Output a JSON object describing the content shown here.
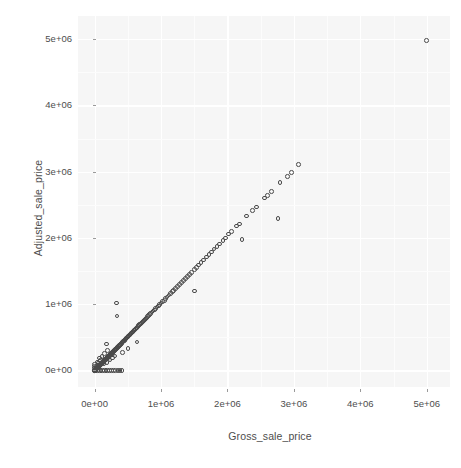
{
  "chart_data": {
    "type": "scatter",
    "title": "",
    "xlabel": "Gross_sale_price",
    "ylabel": "Adjusted_sale_price",
    "xlim": [
      -250000,
      5350000
    ],
    "ylim": [
      -250000,
      5350000
    ],
    "xticks": [
      0,
      1000000,
      2000000,
      3000000,
      4000000,
      5000000
    ],
    "yticks": [
      0,
      1000000,
      2000000,
      3000000,
      4000000,
      5000000
    ],
    "xtick_labels": [
      "0e+00",
      "1e+06",
      "2e+06",
      "3e+06",
      "4e+06",
      "5e+06"
    ],
    "ytick_labels": [
      "0e+00",
      "1e+06",
      "2e+06",
      "3e+06",
      "4e+06",
      "5e+06"
    ],
    "grid": true,
    "legend": "none",
    "marker": "open-circle",
    "marker_color": "#4a4a4a",
    "panel_background": "#f6f6f6",
    "grid_color": "#ffffff",
    "points": [
      [
        5000000,
        4980000
      ],
      [
        3070000,
        3110000
      ],
      [
        2960000,
        2990000
      ],
      [
        2900000,
        2930000
      ],
      [
        2790000,
        2840000
      ],
      [
        2760000,
        2290000
      ],
      [
        2660000,
        2700000
      ],
      [
        2600000,
        2640000
      ],
      [
        2560000,
        2600000
      ],
      [
        2440000,
        2470000
      ],
      [
        2380000,
        2410000
      ],
      [
        2290000,
        2330000
      ],
      [
        2180000,
        2210000
      ],
      [
        2140000,
        2180000
      ],
      [
        2060000,
        2100000
      ],
      [
        2020000,
        2060000
      ],
      [
        1970000,
        2000000
      ],
      [
        1930000,
        1960000
      ],
      [
        1880000,
        1910000
      ],
      [
        1840000,
        1870000
      ],
      [
        1800000,
        1830000
      ],
      [
        1760000,
        1790000
      ],
      [
        1720000,
        1750000
      ],
      [
        1680000,
        1710000
      ],
      [
        1640000,
        1670000
      ],
      [
        1600000,
        1630000
      ],
      [
        1560000,
        1590000
      ],
      [
        1530000,
        1550000
      ],
      [
        1500000,
        1520000
      ],
      [
        1460000,
        1480000
      ],
      [
        1430000,
        1450000
      ],
      [
        1400000,
        1420000
      ],
      [
        1370000,
        1390000
      ],
      [
        1340000,
        1360000
      ],
      [
        1310000,
        1330000
      ],
      [
        1280000,
        1300000
      ],
      [
        1250000,
        1270000
      ],
      [
        1220000,
        1240000
      ],
      [
        1190000,
        1210000
      ],
      [
        1170000,
        1190000
      ],
      [
        1140000,
        1160000
      ],
      [
        1120000,
        1140000
      ],
      [
        1090000,
        1110000
      ],
      [
        1070000,
        1090000
      ],
      [
        1050000,
        1060000
      ],
      [
        1020000,
        1040000
      ],
      [
        1000000,
        1020000
      ],
      [
        980000,
        995000
      ],
      [
        960000,
        975000
      ],
      [
        940000,
        955000
      ],
      [
        920000,
        935000
      ],
      [
        900000,
        915000
      ],
      [
        880000,
        895000
      ],
      [
        865000,
        880000
      ],
      [
        845000,
        860000
      ],
      [
        830000,
        845000
      ],
      [
        810000,
        825000
      ],
      [
        795000,
        810000
      ],
      [
        780000,
        793000
      ],
      [
        765000,
        778000
      ],
      [
        750000,
        763000
      ],
      [
        735000,
        748000
      ],
      [
        720000,
        733000
      ],
      [
        705000,
        718000
      ],
      [
        692000,
        704000
      ],
      [
        678000,
        690000
      ],
      [
        665000,
        677000
      ],
      [
        652000,
        663000
      ],
      [
        640000,
        651000
      ],
      [
        627000,
        638000
      ],
      [
        615000,
        626000
      ],
      [
        603000,
        613000
      ],
      [
        591000,
        601000
      ],
      [
        579000,
        589000
      ],
      [
        568000,
        578000
      ],
      [
        557000,
        566000
      ],
      [
        546000,
        555000
      ],
      [
        535000,
        544000
      ],
      [
        524000,
        533000
      ],
      [
        514000,
        522000
      ],
      [
        504000,
        512000
      ],
      [
        494000,
        502000
      ],
      [
        484000,
        492000
      ],
      [
        474000,
        482000
      ],
      [
        465000,
        472000
      ],
      [
        455000,
        462000
      ],
      [
        446000,
        453000
      ],
      [
        437000,
        444000
      ],
      [
        428000,
        435000
      ],
      [
        420000,
        427000
      ],
      [
        411000,
        418000
      ],
      [
        403000,
        409000
      ],
      [
        395000,
        401000
      ],
      [
        387000,
        393000
      ],
      [
        379000,
        385000
      ],
      [
        371000,
        377000
      ],
      [
        364000,
        369000
      ],
      [
        356000,
        362000
      ],
      [
        349000,
        354000
      ],
      [
        342000,
        347000
      ],
      [
        335000,
        340000
      ],
      [
        328000,
        333000
      ],
      [
        321000,
        326000
      ],
      [
        315000,
        319000
      ],
      [
        308000,
        313000
      ],
      [
        302000,
        306000
      ],
      [
        296000,
        300000
      ],
      [
        290000,
        294000
      ],
      [
        284000,
        288000
      ],
      [
        278000,
        282000
      ],
      [
        272000,
        276000
      ],
      [
        267000,
        271000
      ],
      [
        261000,
        265000
      ],
      [
        256000,
        260000
      ],
      [
        251000,
        255000
      ],
      [
        246000,
        249000
      ],
      [
        241000,
        244000
      ],
      [
        236000,
        239000
      ],
      [
        231000,
        234000
      ],
      [
        226000,
        229000
      ],
      [
        221000,
        224000
      ],
      [
        217000,
        220000
      ],
      [
        212000,
        215000
      ],
      [
        208000,
        211000
      ],
      [
        204000,
        207000
      ],
      [
        200000,
        203000
      ],
      [
        196000,
        198000
      ],
      [
        192000,
        194000
      ],
      [
        188000,
        190000
      ],
      [
        184000,
        186000
      ],
      [
        180000,
        182000
      ],
      [
        176000,
        178000
      ],
      [
        173000,
        175000
      ],
      [
        169000,
        171000
      ],
      [
        166000,
        168000
      ],
      [
        162000,
        164000
      ],
      [
        159000,
        161000
      ],
      [
        156000,
        158000
      ],
      [
        152000,
        154000
      ],
      [
        149000,
        151000
      ],
      [
        146000,
        148000
      ],
      [
        143000,
        145000
      ],
      [
        140000,
        142000
      ],
      [
        137000,
        139000
      ],
      [
        134000,
        136000
      ],
      [
        131000,
        133000
      ],
      [
        129000,
        130000
      ],
      [
        126000,
        128000
      ],
      [
        123000,
        125000
      ],
      [
        121000,
        122000
      ],
      [
        118000,
        120000
      ],
      [
        116000,
        117000
      ],
      [
        113000,
        115000
      ],
      [
        111000,
        112000
      ],
      [
        109000,
        110000
      ],
      [
        106000,
        108000
      ],
      [
        104000,
        105000
      ],
      [
        102000,
        103000
      ],
      [
        100000,
        101000
      ],
      [
        98000,
        99000
      ],
      [
        96000,
        97000
      ],
      [
        94000,
        95000
      ],
      [
        92000,
        93000
      ],
      [
        90000,
        91000
      ],
      [
        88000,
        89000
      ],
      [
        86000,
        87000
      ],
      [
        84000,
        85000
      ],
      [
        82000,
        83000
      ],
      [
        80000,
        81000
      ],
      [
        78000,
        79000
      ],
      [
        76000,
        77000
      ],
      [
        75000,
        76000
      ],
      [
        73000,
        74000
      ],
      [
        71000,
        72000
      ],
      [
        69000,
        70000
      ],
      [
        68000,
        69000
      ],
      [
        66000,
        67000
      ],
      [
        64000,
        65000
      ],
      [
        63000,
        64000
      ],
      [
        61000,
        62000
      ],
      [
        60000,
        61000
      ],
      [
        58000,
        59000
      ],
      [
        57000,
        58000
      ],
      [
        55000,
        56000
      ],
      [
        54000,
        55000
      ],
      [
        52000,
        53000
      ],
      [
        51000,
        52000
      ],
      [
        50000,
        50500
      ],
      [
        48000,
        49000
      ],
      [
        47000,
        47500
      ],
      [
        46000,
        46500
      ],
      [
        44000,
        45000
      ],
      [
        43000,
        43500
      ],
      [
        42000,
        42500
      ],
      [
        41000,
        41500
      ],
      [
        40000,
        40500
      ],
      [
        38000,
        38500
      ],
      [
        37000,
        37500
      ],
      [
        36000,
        36500
      ],
      [
        35000,
        35500
      ],
      [
        34000,
        34500
      ],
      [
        33000,
        33500
      ],
      [
        32000,
        32500
      ],
      [
        31000,
        31500
      ],
      [
        30000,
        30500
      ],
      [
        29000,
        29500
      ],
      [
        28000,
        28500
      ],
      [
        27000,
        27500
      ],
      [
        26000,
        26500
      ],
      [
        25000,
        25500
      ],
      [
        24000,
        24500
      ],
      [
        23000,
        23500
      ],
      [
        22000,
        22500
      ],
      [
        21000,
        21500
      ],
      [
        20000,
        20500
      ],
      [
        19000,
        19500
      ],
      [
        18000,
        18500
      ],
      [
        17000,
        17500
      ],
      [
        16000,
        16500
      ],
      [
        15000,
        15500
      ],
      [
        14000,
        14500
      ],
      [
        13000,
        13500
      ],
      [
        12000,
        12500
      ],
      [
        11000,
        11500
      ],
      [
        10000,
        10500
      ],
      [
        9000,
        9500
      ],
      [
        8000,
        8500
      ],
      [
        7000,
        7500
      ],
      [
        6000,
        6500
      ],
      [
        5000,
        5500
      ],
      [
        4000,
        4500
      ],
      [
        3000,
        3500
      ],
      [
        2000,
        2500
      ],
      [
        1000,
        1500
      ],
      [
        330000,
        1020000
      ],
      [
        340000,
        820000
      ],
      [
        175000,
        400000
      ],
      [
        195000,
        300000
      ],
      [
        150000,
        255000
      ],
      [
        1500000,
        1200000
      ],
      [
        2220000,
        1980000
      ],
      [
        640000,
        430000
      ],
      [
        420000,
        270000
      ],
      [
        500000,
        330000
      ],
      [
        20000,
        0
      ],
      [
        45000,
        0
      ],
      [
        70000,
        0
      ],
      [
        95000,
        0
      ],
      [
        120000,
        0
      ],
      [
        145000,
        0
      ],
      [
        170000,
        0
      ],
      [
        196000,
        0
      ],
      [
        225000,
        0
      ],
      [
        255000,
        0
      ],
      [
        285000,
        0
      ],
      [
        315000,
        0
      ],
      [
        350000,
        0
      ],
      [
        385000,
        0
      ],
      [
        415000,
        0
      ],
      [
        0,
        0
      ],
      [
        0,
        25000
      ],
      [
        0,
        55000
      ],
      [
        0,
        90000
      ],
      [
        30000,
        60000
      ],
      [
        60000,
        110000
      ],
      [
        90000,
        150000
      ],
      [
        40000,
        130000
      ],
      [
        110000,
        210000
      ],
      [
        75000,
        185000
      ],
      [
        140000,
        95000
      ],
      [
        185000,
        120000
      ],
      [
        230000,
        160000
      ],
      [
        270000,
        190000
      ],
      [
        310000,
        215000
      ]
    ]
  },
  "axis": {
    "x_title": "Gross_sale_price",
    "y_title": "Adjusted_sale_price"
  }
}
